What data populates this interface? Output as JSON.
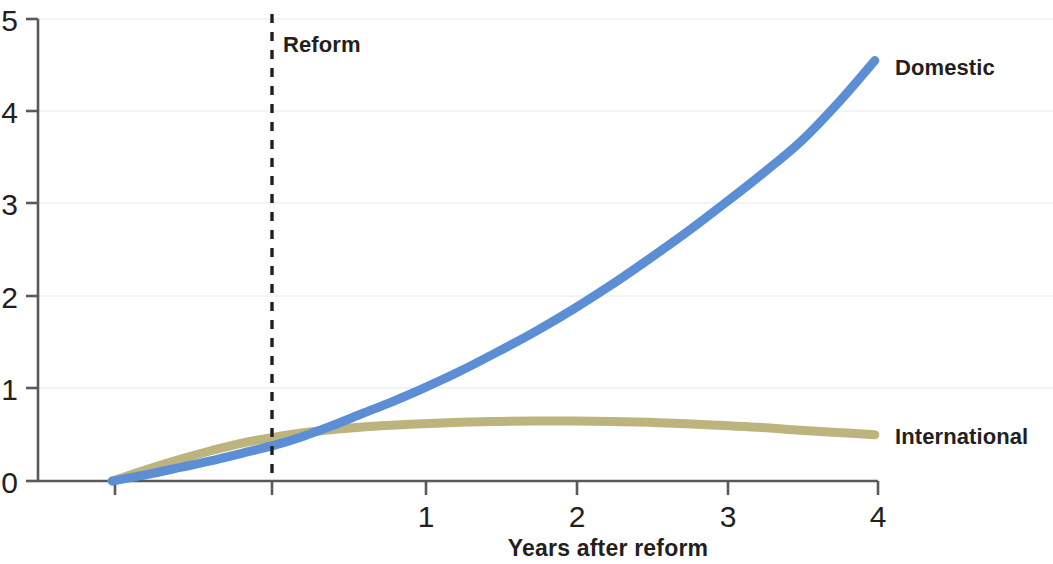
{
  "chart_data": {
    "type": "line",
    "title": "",
    "xlabel": "Years after reform",
    "ylabel": "",
    "xlim": [
      -1.06,
      4
    ],
    "ylim": [
      0,
      5
    ],
    "grid": true,
    "grid_axis": "y",
    "legend_position": "right-inline",
    "x_ticks": [
      1,
      2,
      3,
      4
    ],
    "x_tick_labels": [
      "1",
      "2",
      "3",
      "4"
    ],
    "x_minor_ticks": [
      -1,
      0
    ],
    "y_ticks": [
      0,
      1,
      2,
      3,
      4,
      5
    ],
    "y_tick_labels": [
      "0",
      "1",
      "2",
      "3",
      "4",
      "5"
    ],
    "annotations": [
      {
        "name": "reform-line",
        "label": "Reform",
        "x": 0,
        "style": "dashed-vertical"
      }
    ],
    "series": [
      {
        "name": "Domestic",
        "color": "#5b8ed4",
        "label": "Domestic",
        "x": [
          -1.06,
          -0.8,
          -0.6,
          -0.4,
          -0.2,
          0,
          0.2,
          0.4,
          0.6,
          0.8,
          1,
          1.25,
          1.5,
          1.75,
          2,
          2.25,
          2.5,
          2.75,
          3,
          3.25,
          3.5,
          3.75,
          4
        ],
        "values": [
          0,
          0.08,
          0.15,
          0.22,
          0.3,
          0.38,
          0.48,
          0.6,
          0.73,
          0.86,
          1.0,
          1.19,
          1.4,
          1.62,
          1.86,
          2.12,
          2.4,
          2.69,
          3.0,
          3.32,
          3.66,
          4.08,
          4.55
        ]
      },
      {
        "name": "International",
        "color": "#bdb47d",
        "label": "International",
        "x": [
          -1.06,
          -0.8,
          -0.6,
          -0.4,
          -0.2,
          0,
          0.25,
          0.5,
          0.75,
          1,
          1.25,
          1.5,
          1.75,
          2,
          2.25,
          2.5,
          2.75,
          3,
          3.25,
          3.5,
          3.75,
          4
        ],
        "values": [
          0,
          0.14,
          0.24,
          0.33,
          0.41,
          0.47,
          0.53,
          0.57,
          0.6,
          0.62,
          0.635,
          0.645,
          0.65,
          0.65,
          0.645,
          0.635,
          0.62,
          0.6,
          0.58,
          0.55,
          0.525,
          0.5
        ]
      }
    ]
  },
  "axis": {
    "x_title": "Years after reform"
  },
  "labels": {
    "domestic": "Domestic",
    "international": "International",
    "reform": "Reform"
  },
  "ticks": {
    "y": [
      "0",
      "1",
      "2",
      "3",
      "4",
      "5"
    ],
    "x": [
      "1",
      "2",
      "3",
      "4"
    ]
  },
  "colors": {
    "domestic": "#5b8ed4",
    "international": "#bdb47d",
    "axis": "#58595b",
    "text": "#231f20",
    "grid": "#f4f4f5"
  }
}
